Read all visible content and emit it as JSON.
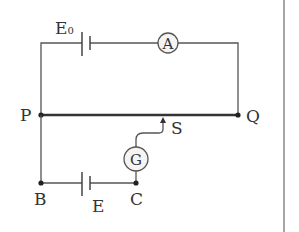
{
  "diagram": {
    "type": "potentiometer-circuit",
    "nodes": {
      "P": "P",
      "Q": "Q",
      "B": "B",
      "C": "C",
      "S": "S"
    },
    "components": {
      "main_battery": {
        "label": "E",
        "subscript": "0"
      },
      "ammeter": {
        "label": "A"
      },
      "galvanometer": {
        "label": "G"
      },
      "test_battery": {
        "label": "E"
      }
    },
    "wires": [
      "P to E0 to A to Q (top loop)",
      "P to Q (resistance wire)",
      "P to B",
      "B to E to C",
      "C to G to sliding contact S on PQ"
    ],
    "colors": {
      "wire": "#555555",
      "resistance_wire": "#333333",
      "meter_fill": "#f6f3f3"
    }
  }
}
